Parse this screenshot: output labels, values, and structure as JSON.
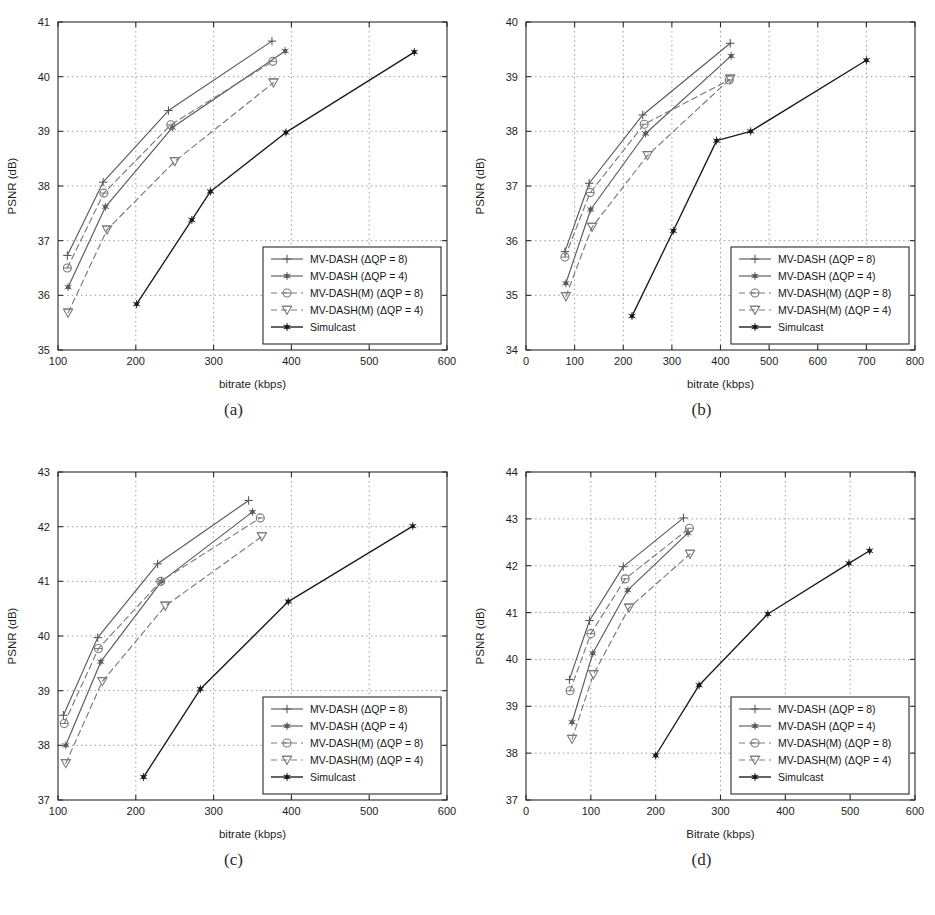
{
  "figure": {
    "panels": [
      {
        "id": "a",
        "caption": "(a)",
        "xlabel": "bitrate (kbps)",
        "ylabel": "PSNR (dB)",
        "xlim": [
          100,
          600
        ],
        "ylim": [
          35,
          41
        ],
        "xticks": [
          100,
          200,
          300,
          400,
          500,
          600
        ],
        "yticks": [
          35,
          36,
          37,
          38,
          39,
          40,
          41
        ],
        "grid": true,
        "legend_position": "lower-right",
        "chart_data": {
          "type": "line",
          "title": "",
          "xlabel": "bitrate (kbps)",
          "ylabel": "PSNR (dB)",
          "xlim": [
            100,
            600
          ],
          "ylim": [
            35,
            41
          ],
          "series": [
            {
              "name": "MV-DASH (ΔQP = 8)",
              "marker": "plus",
              "dash": false,
              "color": "#5a5a5a",
              "x": [
                112,
                158,
                242,
                375
              ],
              "y": [
                36.73,
                38.07,
                39.38,
                40.65
              ]
            },
            {
              "name": "MV-DASH (ΔQP = 4)",
              "marker": "star",
              "dash": false,
              "color": "#5a5a5a",
              "x": [
                113,
                161,
                247,
                392
              ],
              "y": [
                36.15,
                37.62,
                39.07,
                40.47
              ]
            },
            {
              "name": "MV-DASH(M) (ΔQP = 8)",
              "marker": "circle",
              "dash": true,
              "color": "#7a7a7a",
              "x": [
                112,
                159,
                245,
                376
              ],
              "y": [
                36.5,
                37.87,
                39.12,
                40.28
              ]
            },
            {
              "name": "MV-DASH(M) (ΔQP = 4)",
              "marker": "triangle-down",
              "dash": true,
              "color": "#7a7a7a",
              "x": [
                113,
                163,
                250,
                377
              ],
              "y": [
                35.68,
                37.2,
                38.45,
                39.89
              ]
            },
            {
              "name": "Simulcast",
              "marker": "star",
              "dash": false,
              "color": "#1a1a1a",
              "x": [
                201,
                272,
                296,
                393,
                558
              ],
              "y": [
                35.84,
                37.38,
                37.9,
                38.98,
                40.45
              ]
            }
          ]
        }
      },
      {
        "id": "b",
        "caption": "(b)",
        "xlabel": "bitrate (kbps)",
        "ylabel": "PSNR (dB)",
        "xlim": [
          0,
          800
        ],
        "ylim": [
          34,
          40
        ],
        "xticks": [
          0,
          100,
          200,
          300,
          400,
          500,
          600,
          700,
          800
        ],
        "yticks": [
          34,
          35,
          36,
          37,
          38,
          39,
          40
        ],
        "grid": true,
        "legend_position": "lower-right",
        "chart_data": {
          "type": "line",
          "title": "",
          "xlabel": "bitrate (kbps)",
          "ylabel": "PSNR (dB)",
          "xlim": [
            0,
            800
          ],
          "ylim": [
            34,
            40
          ],
          "series": [
            {
              "name": "MV-DASH (ΔQP = 8)",
              "marker": "plus",
              "dash": false,
              "color": "#5a5a5a",
              "x": [
                80,
                130,
                240,
                420
              ],
              "y": [
                35.8,
                37.05,
                38.3,
                39.61
              ]
            },
            {
              "name": "MV-DASH (ΔQP = 4)",
              "marker": "star",
              "dash": false,
              "color": "#5a5a5a",
              "x": [
                82,
                133,
                246,
                422
              ],
              "y": [
                35.22,
                36.57,
                37.96,
                39.38
              ]
            },
            {
              "name": "MV-DASH(M) (ΔQP = 8)",
              "marker": "circle",
              "dash": true,
              "color": "#7a7a7a",
              "x": [
                80,
                132,
                243,
                418
              ],
              "y": [
                35.7,
                36.88,
                38.13,
                38.94
              ]
            },
            {
              "name": "MV-DASH(M) (ΔQP = 4)",
              "marker": "triangle-down",
              "dash": true,
              "color": "#7a7a7a",
              "x": [
                82,
                136,
                250,
                420
              ],
              "y": [
                34.98,
                36.25,
                37.56,
                38.96
              ]
            },
            {
              "name": "Simulcast",
              "marker": "star",
              "dash": false,
              "color": "#1a1a1a",
              "x": [
                218,
                303,
                392,
                462,
                700
              ],
              "y": [
                34.62,
                36.18,
                37.83,
                38.0,
                39.3
              ]
            }
          ]
        }
      },
      {
        "id": "c",
        "caption": "(c)",
        "xlabel": "bitrate (kbps)",
        "ylabel": "PSNR (dB)",
        "xlim": [
          100,
          600
        ],
        "ylim": [
          37,
          43
        ],
        "xticks": [
          100,
          200,
          300,
          400,
          500,
          600
        ],
        "yticks": [
          37,
          38,
          39,
          40,
          41,
          42,
          43
        ],
        "grid": true,
        "legend_position": "lower-right",
        "chart_data": {
          "type": "line",
          "title": "",
          "xlabel": "bitrate (kbps)",
          "ylabel": "PSNR (dB)",
          "xlim": [
            100,
            600
          ],
          "ylim": [
            37,
            43
          ],
          "series": [
            {
              "name": "MV-DASH (ΔQP = 8)",
              "marker": "plus",
              "dash": false,
              "color": "#5a5a5a",
              "x": [
                107,
                151,
                228,
                345
              ],
              "y": [
                38.55,
                39.97,
                41.32,
                42.48
              ]
            },
            {
              "name": "MV-DASH (ΔQP = 4)",
              "marker": "star",
              "dash": false,
              "color": "#5a5a5a",
              "x": [
                110,
                155,
                233,
                350
              ],
              "y": [
                38.0,
                39.53,
                41.0,
                42.27
              ]
            },
            {
              "name": "MV-DASH(M) (ΔQP = 8)",
              "marker": "circle",
              "dash": true,
              "color": "#7a7a7a",
              "x": [
                108,
                152,
                232,
                360
              ],
              "y": [
                38.4,
                39.77,
                41.0,
                42.16
              ]
            },
            {
              "name": "MV-DASH(M) (ΔQP = 4)",
              "marker": "triangle-down",
              "dash": true,
              "color": "#7a7a7a",
              "x": [
                110,
                157,
                238,
                362
              ],
              "y": [
                37.67,
                39.17,
                40.55,
                41.82
              ]
            },
            {
              "name": "Simulcast",
              "marker": "star",
              "dash": false,
              "color": "#1a1a1a",
              "x": [
                210,
                283,
                396,
                556
              ],
              "y": [
                37.42,
                39.03,
                40.63,
                42.01
              ]
            }
          ]
        }
      },
      {
        "id": "d",
        "caption": "(d)",
        "xlabel": "Bitrate (kbps)",
        "ylabel": "PSNR (dB)",
        "xlim": [
          0,
          600
        ],
        "ylim": [
          37,
          44
        ],
        "xticks": [
          0,
          100,
          200,
          300,
          400,
          500,
          600
        ],
        "yticks": [
          37,
          38,
          39,
          40,
          41,
          42,
          43,
          44
        ],
        "grid": true,
        "legend_position": "lower-right",
        "chart_data": {
          "type": "line",
          "title": "",
          "xlabel": "Bitrate (kbps)",
          "ylabel": "PSNR (dB)",
          "xlim": [
            0,
            600
          ],
          "ylim": [
            37,
            44
          ],
          "series": [
            {
              "name": "MV-DASH (ΔQP = 8)",
              "marker": "plus",
              "dash": false,
              "color": "#5a5a5a",
              "x": [
                67,
                98,
                150,
                243
              ],
              "y": [
                39.57,
                40.83,
                41.98,
                43.02
              ]
            },
            {
              "name": "MV-DASH (ΔQP = 4)",
              "marker": "star",
              "dash": false,
              "color": "#5a5a5a",
              "x": [
                71,
                103,
                157,
                250
              ],
              "y": [
                38.66,
                40.13,
                41.48,
                42.7
              ]
            },
            {
              "name": "MV-DASH(M) (ΔQP = 8)",
              "marker": "circle",
              "dash": true,
              "color": "#7a7a7a",
              "x": [
                68,
                100,
                153,
                252
              ],
              "y": [
                39.33,
                40.55,
                41.72,
                42.8
              ]
            },
            {
              "name": "MV-DASH(M) (ΔQP = 4)",
              "marker": "triangle-down",
              "dash": true,
              "color": "#7a7a7a",
              "x": [
                71,
                104,
                159,
                253
              ],
              "y": [
                38.3,
                39.68,
                41.1,
                42.25
              ]
            },
            {
              "name": "Simulcast",
              "marker": "star",
              "dash": false,
              "color": "#1a1a1a",
              "x": [
                200,
                267,
                373,
                498,
                530
              ],
              "y": [
                37.95,
                39.45,
                40.97,
                42.05,
                42.32
              ]
            }
          ]
        }
      }
    ],
    "legend": {
      "entries": [
        {
          "label": "MV-DASH (ΔQP = 8)",
          "marker": "plus",
          "dash": false,
          "color": "#5a5a5a"
        },
        {
          "label": "MV-DASH (ΔQP = 4)",
          "marker": "star",
          "dash": false,
          "color": "#5a5a5a"
        },
        {
          "label": "MV-DASH(M) (ΔQP = 8)",
          "marker": "circle",
          "dash": true,
          "color": "#7a7a7a"
        },
        {
          "label": "MV-DASH(M) (ΔQP = 4)",
          "marker": "triangle-down",
          "dash": true,
          "color": "#7a7a7a"
        },
        {
          "label": "Simulcast",
          "marker": "star",
          "dash": false,
          "color": "#1a1a1a"
        }
      ]
    },
    "colors": {
      "axis": "#2b2b2b",
      "grid": "#8d8d8d",
      "simulcast": "#1a1a1a",
      "mvdash": "#5a5a5a",
      "mvdash_m": "#7a7a7a",
      "background": "#ffffff"
    }
  }
}
